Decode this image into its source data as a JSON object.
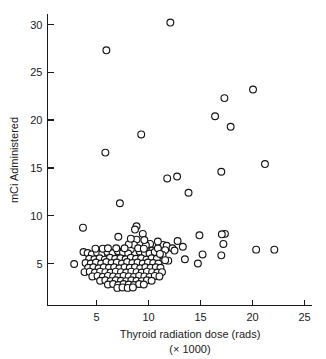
{
  "chart_data": {
    "type": "scatter",
    "title": "",
    "xlabel": "Thyroid radiation dose (rads)",
    "xlabel_secondary": "(× 1000)",
    "ylabel": "mCi Administered",
    "xlim": [
      0,
      25
    ],
    "ylim": [
      0,
      31.5
    ],
    "xticks": [
      5,
      10,
      15,
      20,
      25
    ],
    "xtick_labels": [
      "5",
      "10",
      "15",
      "20",
      "25"
    ],
    "yticks": [
      5,
      10,
      15,
      20,
      25,
      30
    ],
    "ytick_labels": [
      "5",
      "10",
      "15",
      "20",
      "25",
      "30"
    ],
    "grid": false,
    "legend": null,
    "marker": "open-circle",
    "marker_color": "#ffffff",
    "marker_edge_color": "#141414",
    "marker_radius_px": 3.4,
    "n_points": 167,
    "points": [
      [
        12.1,
        30.2
      ],
      [
        5.95,
        27.3
      ],
      [
        20.05,
        23.2
      ],
      [
        17.3,
        22.3
      ],
      [
        16.4,
        20.4
      ],
      [
        17.9,
        19.3
      ],
      [
        9.3,
        18.5
      ],
      [
        5.85,
        16.6
      ],
      [
        21.2,
        15.4
      ],
      [
        17.0,
        14.6
      ],
      [
        12.75,
        14.1
      ],
      [
        11.8,
        13.9
      ],
      [
        13.85,
        12.4
      ],
      [
        7.25,
        11.3
      ],
      [
        3.7,
        8.75
      ],
      [
        8.85,
        8.9
      ],
      [
        8.7,
        8.55
      ],
      [
        9.45,
        8.1
      ],
      [
        17.35,
        8.1
      ],
      [
        17.05,
        8.05
      ],
      [
        14.9,
        7.95
      ],
      [
        7.1,
        7.8
      ],
      [
        8.85,
        7.5
      ],
      [
        12.8,
        7.35
      ],
      [
        10.15,
        7.05
      ],
      [
        17.2,
        7.05
      ],
      [
        9.75,
        6.9
      ],
      [
        11.4,
        6.95
      ],
      [
        11.75,
        6.85
      ],
      [
        13.3,
        6.75
      ],
      [
        3.75,
        6.2
      ],
      [
        8.3,
        6.5
      ],
      [
        10.35,
        6.35
      ],
      [
        11.6,
        6.4
      ],
      [
        20.35,
        6.45
      ],
      [
        22.1,
        6.45
      ],
      [
        15.2,
        5.95
      ],
      [
        17.0,
        5.85
      ],
      [
        13.5,
        5.45
      ],
      [
        11.9,
        5.3
      ],
      [
        14.75,
        5.0
      ],
      [
        2.85,
        4.95
      ],
      [
        4.15,
        6.1
      ],
      [
        4.55,
        5.95
      ],
      [
        5.05,
        6.15
      ],
      [
        5.55,
        6.05
      ],
      [
        6.05,
        6.2
      ],
      [
        6.55,
        6.1
      ],
      [
        7.05,
        6.3
      ],
      [
        7.55,
        6.15
      ],
      [
        8.05,
        6.05
      ],
      [
        9.15,
        6.25
      ],
      [
        9.65,
        6.1
      ],
      [
        10.1,
        6.05
      ],
      [
        10.6,
        6.2
      ],
      [
        4.3,
        5.5
      ],
      [
        4.8,
        5.45
      ],
      [
        5.3,
        5.55
      ],
      [
        5.8,
        5.4
      ],
      [
        6.3,
        5.6
      ],
      [
        6.8,
        5.5
      ],
      [
        7.3,
        5.55
      ],
      [
        7.8,
        5.45
      ],
      [
        8.3,
        5.6
      ],
      [
        8.8,
        5.5
      ],
      [
        9.3,
        5.55
      ],
      [
        9.8,
        5.4
      ],
      [
        10.3,
        5.55
      ],
      [
        10.8,
        5.5
      ],
      [
        3.95,
        5.05
      ],
      [
        4.45,
        5.0
      ],
      [
        4.95,
        5.1
      ],
      [
        5.45,
        5.0
      ],
      [
        5.95,
        5.15
      ],
      [
        6.45,
        5.05
      ],
      [
        6.95,
        5.1
      ],
      [
        7.45,
        5.0
      ],
      [
        7.95,
        5.15
      ],
      [
        8.45,
        5.05
      ],
      [
        8.95,
        5.1
      ],
      [
        9.45,
        5.0
      ],
      [
        9.95,
        5.1
      ],
      [
        10.45,
        5.05
      ],
      [
        10.95,
        5.0
      ],
      [
        4.2,
        4.55
      ],
      [
        4.7,
        4.6
      ],
      [
        5.2,
        4.5
      ],
      [
        5.7,
        4.6
      ],
      [
        6.2,
        4.55
      ],
      [
        6.7,
        4.6
      ],
      [
        7.2,
        4.5
      ],
      [
        7.7,
        4.6
      ],
      [
        8.2,
        4.55
      ],
      [
        8.7,
        4.6
      ],
      [
        9.2,
        4.5
      ],
      [
        9.7,
        4.6
      ],
      [
        10.2,
        4.55
      ],
      [
        10.7,
        4.6
      ],
      [
        11.15,
        4.55
      ],
      [
        3.85,
        4.1
      ],
      [
        4.35,
        4.15
      ],
      [
        4.85,
        4.05
      ],
      [
        5.35,
        4.15
      ],
      [
        5.85,
        4.1
      ],
      [
        6.35,
        4.05
      ],
      [
        6.85,
        4.15
      ],
      [
        7.35,
        4.1
      ],
      [
        7.85,
        4.05
      ],
      [
        8.35,
        4.15
      ],
      [
        8.85,
        4.1
      ],
      [
        9.35,
        4.05
      ],
      [
        9.85,
        4.15
      ],
      [
        10.35,
        4.1
      ],
      [
        10.85,
        4.05
      ],
      [
        11.3,
        4.1
      ],
      [
        4.6,
        3.65
      ],
      [
        5.1,
        3.7
      ],
      [
        5.6,
        3.6
      ],
      [
        6.1,
        3.7
      ],
      [
        6.6,
        3.65
      ],
      [
        7.1,
        3.6
      ],
      [
        7.6,
        3.7
      ],
      [
        8.1,
        3.65
      ],
      [
        8.6,
        3.6
      ],
      [
        9.1,
        3.7
      ],
      [
        9.6,
        3.65
      ],
      [
        10.1,
        3.6
      ],
      [
        10.6,
        3.7
      ],
      [
        11.05,
        3.65
      ],
      [
        5.35,
        3.2
      ],
      [
        5.85,
        3.25
      ],
      [
        6.35,
        3.15
      ],
      [
        6.85,
        3.25
      ],
      [
        7.35,
        3.2
      ],
      [
        7.85,
        3.15
      ],
      [
        8.35,
        3.25
      ],
      [
        8.85,
        3.2
      ],
      [
        9.35,
        3.15
      ],
      [
        9.85,
        3.25
      ],
      [
        10.3,
        3.2
      ],
      [
        6.1,
        2.8
      ],
      [
        6.6,
        2.85
      ],
      [
        7.1,
        2.75
      ],
      [
        7.6,
        2.85
      ],
      [
        8.1,
        2.8
      ],
      [
        8.6,
        2.75
      ],
      [
        9.1,
        2.85
      ],
      [
        9.55,
        2.8
      ],
      [
        7.0,
        2.45
      ],
      [
        7.5,
        2.5
      ],
      [
        8.0,
        2.45
      ],
      [
        8.5,
        2.5
      ],
      [
        5.6,
        6.55
      ],
      [
        6.1,
        6.6
      ],
      [
        6.9,
        6.6
      ],
      [
        8.6,
        6.95
      ],
      [
        9.0,
        6.6
      ],
      [
        9.55,
        6.55
      ],
      [
        10.9,
        6.6
      ],
      [
        4.9,
        6.55
      ],
      [
        8.1,
        7.0
      ],
      [
        7.7,
        6.6
      ],
      [
        11.35,
        5.9
      ],
      [
        11.6,
        5.35
      ],
      [
        12.3,
        6.6
      ],
      [
        12.5,
        6.35
      ],
      [
        11.1,
        6.0
      ],
      [
        10.9,
        7.3
      ],
      [
        8.3,
        7.6
      ],
      [
        9.6,
        7.45
      ]
    ]
  },
  "figure": {
    "background_color": "#ffffff",
    "axis_color": "#1a1a1a",
    "text_color": "#1a1a1a"
  }
}
